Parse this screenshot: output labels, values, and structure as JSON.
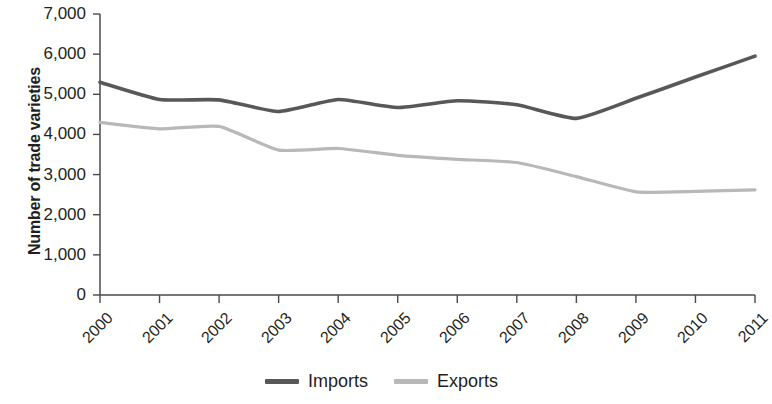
{
  "chart_data": {
    "type": "line",
    "title": "",
    "subtitle": "",
    "xlabel": "",
    "ylabel": "Number of trade varieties",
    "categories": [
      "2000",
      "2001",
      "2002",
      "2003",
      "2004",
      "2005",
      "2006",
      "2007",
      "2008",
      "2009",
      "2010",
      "2011"
    ],
    "x": [
      2000,
      2001,
      2002,
      2003,
      2004,
      2005,
      2006,
      2007,
      2008,
      2009,
      2010,
      2011
    ],
    "series": [
      {
        "name": "Imports",
        "color": "#58585a",
        "values": [
          5300,
          4870,
          4860,
          4570,
          4870,
          4670,
          4840,
          4740,
          4400,
          4900,
          5430,
          5950
        ]
      },
      {
        "name": "Exports",
        "color": "#b8b8b8",
        "values": [
          4300,
          4140,
          4200,
          3610,
          3650,
          3480,
          3380,
          3300,
          2950,
          2570,
          2580,
          2620
        ]
      }
    ],
    "ylim": [
      0,
      7000
    ],
    "ytick_values": [
      0,
      1000,
      2000,
      3000,
      4000,
      5000,
      6000,
      7000
    ],
    "ytick_labels": [
      "0",
      "1,000",
      "2,000",
      "3,000",
      "4,000",
      "5,000",
      "6,000",
      "7,000"
    ],
    "xlim": [
      2000,
      2011
    ],
    "grid": false,
    "legend_position": "bottom",
    "xtick_rotation": -45
  },
  "legend": {
    "entries": [
      {
        "label": "Imports",
        "color": "#58585a"
      },
      {
        "label": "Exports",
        "color": "#b8b8b8"
      }
    ]
  },
  "axes": {
    "y_title": "Number of trade varieties"
  }
}
